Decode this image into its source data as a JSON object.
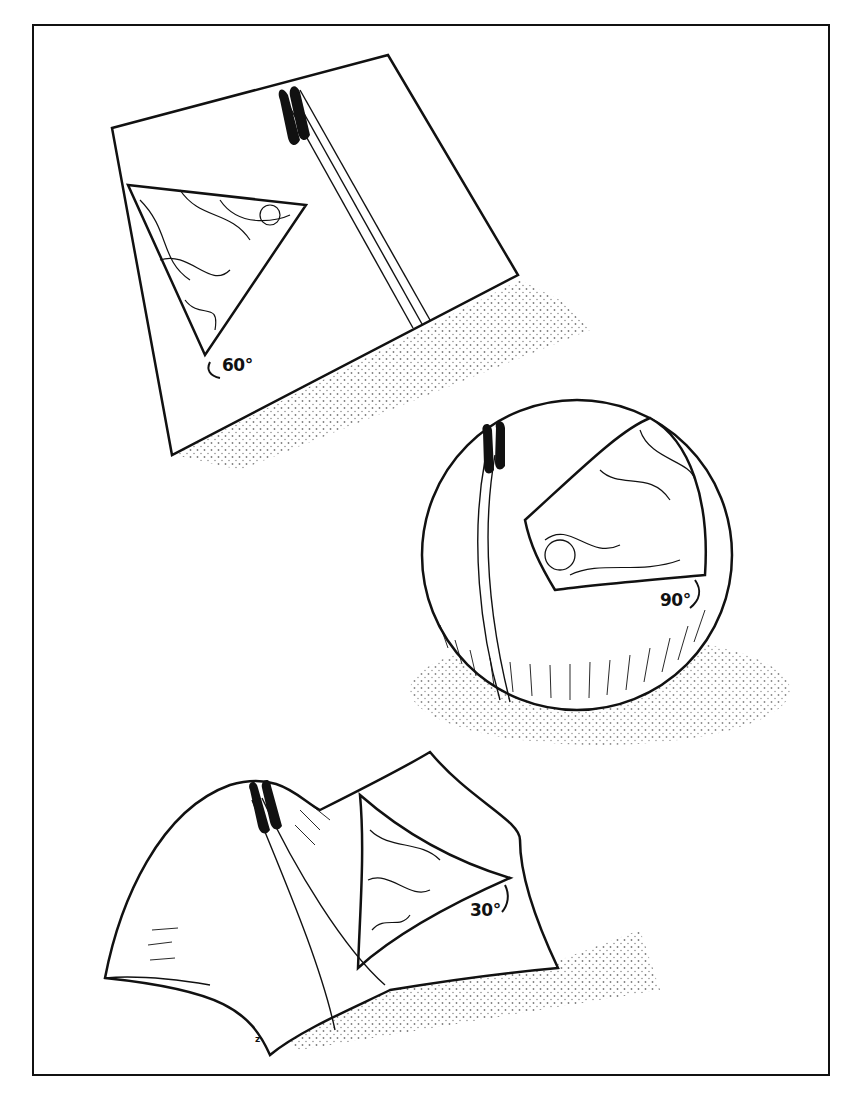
{
  "figure": {
    "panels": [
      {
        "surface": "flat-plane",
        "angle_label": "60°"
      },
      {
        "surface": "sphere",
        "angle_label": "90°"
      },
      {
        "surface": "saddle",
        "angle_label": "30°"
      }
    ],
    "signature": "z",
    "colors": {
      "ink": "#111111",
      "paper": "#ffffff"
    }
  }
}
